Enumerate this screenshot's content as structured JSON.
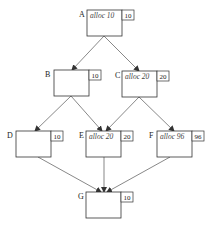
{
  "diagram": {
    "nodes": [
      {
        "id": "A",
        "label": "A",
        "alloc": "alloc 10",
        "size": "10",
        "x": 87,
        "y": 10
      },
      {
        "id": "B",
        "label": "B",
        "alloc": "",
        "size": "10",
        "x": 54,
        "y": 70
      },
      {
        "id": "C",
        "label": "C",
        "alloc": "alloc 20",
        "size": "20",
        "x": 122,
        "y": 71
      },
      {
        "id": "D",
        "label": "D",
        "alloc": "",
        "size": "10",
        "x": 16,
        "y": 131
      },
      {
        "id": "E",
        "label": "E",
        "alloc": "alloc 20",
        "size": "20",
        "x": 86,
        "y": 131
      },
      {
        "id": "F",
        "label": "F",
        "alloc": "alloc 96",
        "size": "96",
        "x": 157,
        "y": 131
      },
      {
        "id": "G",
        "label": "G",
        "alloc": "",
        "size": "10",
        "x": 86,
        "y": 192
      }
    ],
    "edges": [
      {
        "from": "A",
        "to": "B"
      },
      {
        "from": "A",
        "to": "C"
      },
      {
        "from": "B",
        "to": "D"
      },
      {
        "from": "B",
        "to": "E"
      },
      {
        "from": "C",
        "to": "E"
      },
      {
        "from": "C",
        "to": "F"
      },
      {
        "from": "D",
        "to": "G"
      },
      {
        "from": "E",
        "to": "G"
      },
      {
        "from": "F",
        "to": "G"
      }
    ]
  }
}
